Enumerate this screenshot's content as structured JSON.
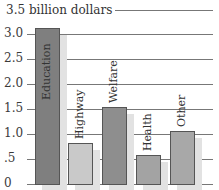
{
  "chart_data": {
    "type": "bar",
    "title": "3.5 billion dollars",
    "categories": [
      "Education",
      "Highway",
      "Welfare",
      "Health",
      "Other"
    ],
    "values": [
      3.12,
      0.82,
      1.54,
      0.58,
      1.06
    ],
    "xlabel": "",
    "ylabel": "billion dollars",
    "ylim": [
      0,
      3.5
    ],
    "yticks": [
      "0",
      ".5",
      "1.0",
      "1.5",
      "2.0",
      "2.5",
      "3.0",
      "3.5"
    ],
    "grid": true,
    "legend": null,
    "colors": [
      "#7f7f7f",
      "#c9c9c9",
      "#8e8e8e",
      "#a3a3a3",
      "#a8a8a8"
    ]
  },
  "yaxis": {
    "title": "3.5 billion dollars",
    "ticks": [
      "3.0",
      "2.5",
      "2.0",
      "1.5",
      "1.0",
      ".5",
      "0"
    ]
  },
  "bars": [
    {
      "label": "Education",
      "color": "#7f7f7f"
    },
    {
      "label": "Highway",
      "color": "#c9c9c9"
    },
    {
      "label": "Welfare",
      "color": "#8e8e8e"
    },
    {
      "label": "Health",
      "color": "#a3a3a3"
    },
    {
      "label": "Other",
      "color": "#a8a8a8"
    }
  ]
}
